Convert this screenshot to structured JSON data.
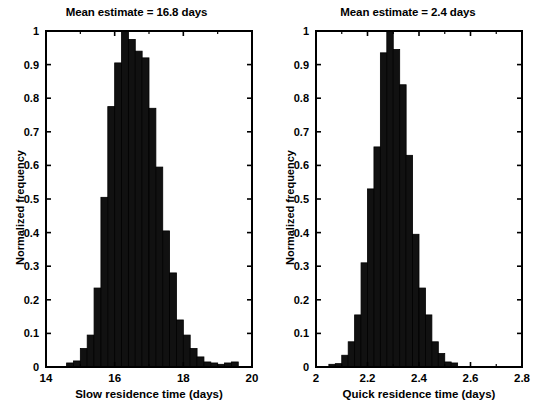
{
  "figure": {
    "background": "#ffffff",
    "ink": "#000000",
    "bar_color": "#111111",
    "bar_edge_color": "#000000"
  },
  "chart_data": [
    {
      "type": "bar",
      "id": "slow-residence-time-histogram",
      "title": "Mean estimate = 16.8 days",
      "xlabel": "Slow residence time (days)",
      "ylabel": "Normalized frequency",
      "xlim": [
        14,
        20
      ],
      "ylim": [
        0,
        1
      ],
      "grid": false,
      "legend": null,
      "xticks": [
        14,
        16,
        18,
        20
      ],
      "xtick_labels": [
        "14",
        "16",
        "18",
        "20"
      ],
      "xminorticks": [
        15,
        17,
        19
      ],
      "yticks": [
        0,
        0.1,
        0.2,
        0.3,
        0.4,
        0.5,
        0.6,
        0.7,
        0.8,
        0.9,
        1
      ],
      "ytick_labels": [
        "0",
        "0.1",
        "0.2",
        "0.3",
        "0.4",
        "0.5",
        "0.6",
        "0.7",
        "0.8",
        "0.9",
        "1"
      ],
      "bin_width": 0.2,
      "bin_edges": [
        14.6,
        14.8,
        15.0,
        15.2,
        15.4,
        15.6,
        15.8,
        16.0,
        16.2,
        16.4,
        16.6,
        16.8,
        17.0,
        17.2,
        17.4,
        17.6,
        17.8,
        18.0,
        18.2,
        18.4,
        18.6,
        18.8,
        19.0,
        19.2,
        19.4,
        19.6
      ],
      "bin_centers": [
        14.7,
        14.9,
        15.1,
        15.3,
        15.5,
        15.7,
        15.9,
        16.1,
        16.3,
        16.5,
        16.7,
        16.9,
        17.1,
        17.3,
        17.5,
        17.7,
        17.9,
        18.1,
        18.3,
        18.5,
        18.7,
        18.9,
        19.1,
        19.3,
        19.5
      ],
      "values": [
        0.012,
        0.018,
        0.055,
        0.095,
        0.235,
        0.505,
        0.775,
        0.905,
        1.0,
        0.975,
        0.94,
        0.92,
        0.77,
        0.595,
        0.405,
        0.28,
        0.14,
        0.095,
        0.055,
        0.03,
        0.015,
        0.012,
        0.008,
        0.012,
        0.015
      ],
      "mean_estimate": 16.8,
      "mean_units": "days"
    },
    {
      "type": "bar",
      "id": "quick-residence-time-histogram",
      "title": "Mean estimate = 2.4 days",
      "xlabel": "Quick residence time (days)",
      "ylabel": "Normalized frequency",
      "xlim": [
        2,
        2.8
      ],
      "ylim": [
        0,
        1
      ],
      "grid": false,
      "legend": null,
      "xticks": [
        2,
        2.2,
        2.4,
        2.6,
        2.8
      ],
      "xtick_labels": [
        "2",
        "2.2",
        "2.4",
        "2.6",
        "2.8"
      ],
      "xminorticks": [
        2.1,
        2.3,
        2.5,
        2.7
      ],
      "yticks": [
        0,
        0.1,
        0.2,
        0.3,
        0.4,
        0.5,
        0.6,
        0.7,
        0.8,
        0.9,
        1
      ],
      "ytick_labels": [
        "0",
        "0.1",
        "0.2",
        "0.3",
        "0.4",
        "0.5",
        "0.6",
        "0.7",
        "0.8",
        "0.9",
        "1"
      ],
      "bin_width": 0.025,
      "bin_edges": [
        2.05,
        2.075,
        2.1,
        2.125,
        2.15,
        2.175,
        2.2,
        2.225,
        2.25,
        2.275,
        2.3,
        2.325,
        2.35,
        2.375,
        2.4,
        2.425,
        2.45,
        2.475,
        2.5,
        2.525,
        2.55,
        2.575,
        2.6,
        2.625,
        2.65,
        2.675,
        2.7,
        2.725,
        2.75,
        2.775
      ],
      "bin_centers": [
        2.0625,
        2.0875,
        2.1125,
        2.1375,
        2.1625,
        2.1875,
        2.2125,
        2.2375,
        2.2625,
        2.2875,
        2.3125,
        2.3375,
        2.3625,
        2.3875,
        2.4125,
        2.4375,
        2.4625,
        2.4875,
        2.5125,
        2.5375,
        2.5625,
        2.5875,
        2.6125,
        2.6375,
        2.6625,
        2.6875,
        2.7125,
        2.7375,
        2.7625
      ],
      "values": [
        0.008,
        0.01,
        0.035,
        0.075,
        0.155,
        0.31,
        0.53,
        0.655,
        0.935,
        1.0,
        0.945,
        0.84,
        0.63,
        0.395,
        0.235,
        0.155,
        0.075,
        0.04,
        0.015,
        0.012
      ],
      "values_full": [
        0.008,
        0.01,
        0.035,
        0.075,
        0.155,
        0.31,
        0.53,
        0.655,
        0.935,
        1.0,
        0.945,
        0.84,
        0.63,
        0.395,
        0.235,
        0.155,
        0.075,
        0.04,
        0.015,
        0.012
      ],
      "mean_estimate": 2.4,
      "mean_units": "days"
    }
  ],
  "panels": {
    "left": {
      "title": "Mean estimate = 16.8 days",
      "xlabel": "Slow residence time (days)",
      "ylabel": "Normalized frequency",
      "xtick_labels": [
        "14",
        "16",
        "18",
        "20"
      ],
      "ytick_labels": [
        "1",
        "0.9",
        "0.8",
        "0.7",
        "0.6",
        "0.5",
        "0.4",
        "0.3",
        "0.2",
        "0.1",
        "0"
      ]
    },
    "right": {
      "title": "Mean estimate = 2.4 days",
      "xlabel": "Quick residence time (days)",
      "ylabel": "Normalized frequency",
      "xtick_labels": [
        "2",
        "2.2",
        "2.4",
        "2.6",
        "2.8"
      ],
      "ytick_labels": [
        "1",
        "0.9",
        "0.8",
        "0.7",
        "0.6",
        "0.5",
        "0.4",
        "0.3",
        "0.2",
        "0.1",
        "0"
      ]
    }
  }
}
